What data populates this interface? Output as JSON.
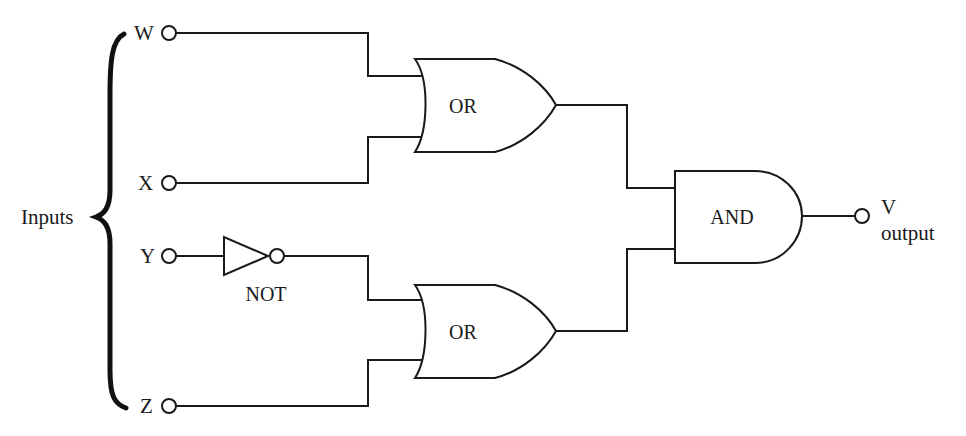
{
  "inputs_group_label": "Inputs",
  "inputs": [
    {
      "id": "W",
      "label": "W"
    },
    {
      "id": "X",
      "label": "X"
    },
    {
      "id": "Y",
      "label": "Y"
    },
    {
      "id": "Z",
      "label": "Z"
    }
  ],
  "gates": {
    "or_top": {
      "type": "OR",
      "label": "OR",
      "inputs": [
        "W",
        "X"
      ]
    },
    "not": {
      "type": "NOT",
      "label": "NOT",
      "inputs": [
        "Y"
      ]
    },
    "or_bottom": {
      "type": "OR",
      "label": "OR",
      "inputs": [
        "NOT Y",
        "Z"
      ]
    },
    "and": {
      "type": "AND",
      "label": "AND",
      "inputs": [
        "OR top",
        "OR bottom"
      ]
    }
  },
  "output": {
    "id": "V",
    "label": "V",
    "caption": "output"
  },
  "colors": {
    "line": "#1a1a1a",
    "background": "#ffffff"
  }
}
